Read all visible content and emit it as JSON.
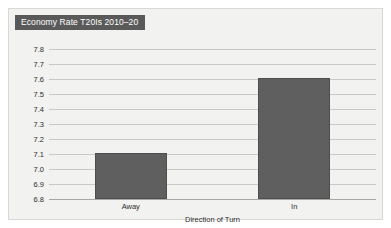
{
  "chart_data": {
    "type": "bar",
    "title": "Economy Rate T20Is 2010–20",
    "xlabel": "Direction of Turn",
    "ylabel": "",
    "categories": [
      "Away",
      "In"
    ],
    "values": [
      7.11,
      7.61
    ],
    "ylim": [
      6.8,
      7.8
    ],
    "ytick_labels": [
      "7.8",
      "7.7",
      "7.6",
      "7.5",
      "7.4",
      "7.3",
      "7.2",
      "7.1",
      "7.0",
      "6.9",
      "6.8"
    ],
    "ytick_values": [
      7.8,
      7.7,
      7.6,
      7.5,
      7.4,
      7.3,
      7.2,
      7.1,
      7.0,
      6.9,
      6.8
    ],
    "grid": true,
    "legend": null,
    "colors": {
      "bar_fill": "#5f5f5f",
      "bar_border": "#4e4e4e",
      "plot_background": "#f2f2f0",
      "gridline": "#c9c9c5",
      "title_bar_background": "#5a5a5a",
      "title_text": "#ffffff",
      "axis_text": "#2e2e2e",
      "frame_border": "#d8d8d4"
    }
  }
}
